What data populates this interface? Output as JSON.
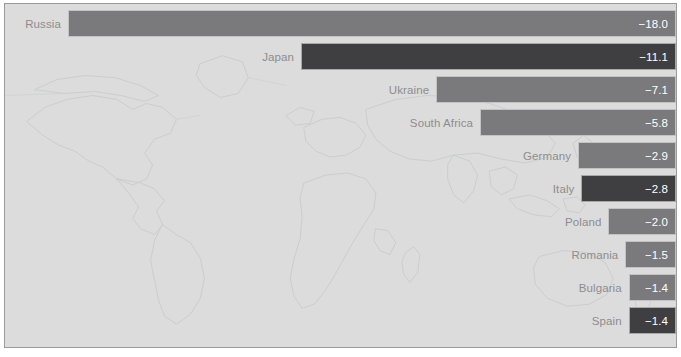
{
  "chart_data": {
    "type": "bar",
    "orientation": "horizontal",
    "title": "",
    "subtitle": "",
    "xlabel": "",
    "ylabel": "",
    "grid": false,
    "legend": null,
    "axis_visible": false,
    "value_alignment": "right-aligned-baseline-at-zero",
    "xlim": [
      -18.6,
      0
    ],
    "categories": [
      "Russia",
      "Japan",
      "Ukraine",
      "South Africa",
      "Germany",
      "Italy",
      "Poland",
      "Romania",
      "Bulgaria",
      "Spain"
    ],
    "values": [
      -18.0,
      -11.1,
      -7.1,
      -5.8,
      -2.9,
      -2.8,
      -2.0,
      -1.5,
      -1.4,
      -1.4
    ],
    "value_labels": [
      "−18.0",
      "−11.1",
      "−7.1",
      "−5.8",
      "−2.9",
      "−2.8",
      "−2.0",
      "−1.5",
      "−1.4",
      "−1.4"
    ],
    "bar_styles": [
      "light",
      "dark",
      "light",
      "light",
      "light",
      "dark",
      "light",
      "light",
      "light",
      "dark"
    ],
    "bars": [
      {
        "label": "Russia",
        "value": -18.0,
        "value_label": "−18.0",
        "style": "dark-gray",
        "top": 6,
        "height": 27
      },
      {
        "label": "Japan",
        "value": -11.1,
        "value_label": "−11.1",
        "style": "charcoal",
        "top": 39,
        "height": 27
      },
      {
        "label": "Ukraine",
        "value": -7.1,
        "value_label": "−7.1",
        "style": "dark-gray",
        "top": 72,
        "height": 27
      },
      {
        "label": "South Africa",
        "value": -5.8,
        "value_label": "−5.8",
        "style": "dark-gray",
        "top": 105,
        "height": 27
      },
      {
        "label": "Germany",
        "value": -2.9,
        "value_label": "−2.9",
        "style": "dark-gray",
        "top": 138,
        "height": 27
      },
      {
        "label": "Italy",
        "value": -2.8,
        "value_label": "−2.8",
        "style": "charcoal",
        "top": 171,
        "height": 27
      },
      {
        "label": "Poland",
        "value": -2.0,
        "value_label": "−2.0",
        "style": "dark-gray",
        "top": 204,
        "height": 27
      },
      {
        "label": "Romania",
        "value": -1.5,
        "value_label": "−1.5",
        "style": "dark-gray",
        "top": 237,
        "height": 27
      },
      {
        "label": "Bulgaria",
        "value": -1.4,
        "value_label": "−1.4",
        "style": "dark-gray",
        "top": 270,
        "height": 27
      },
      {
        "label": "Spain",
        "value": -1.4,
        "value_label": "−1.4",
        "style": "charcoal",
        "top": 303,
        "height": 27
      }
    ]
  },
  "colors": {
    "background": "#dcdcdc",
    "frame_border": "#9a9a9a",
    "bar_light": "#7a7a7c",
    "bar_dark": "#3f3f42",
    "label_text": "#8d8d8d",
    "value_text": "#ffffff",
    "map_stroke": "#9fa6ae",
    "page": "#ffffff"
  },
  "geometry": {
    "plot_left": 4,
    "plot_top": 3,
    "plot_width": 673,
    "plot_height": 345,
    "bar_right_edge": 668,
    "px_per_unit": 33.78
  }
}
